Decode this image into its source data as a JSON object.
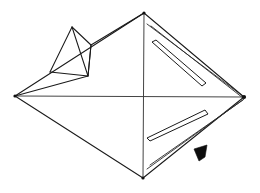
{
  "figure": {
    "kind": "line-drawing",
    "background_color": "#ffffff",
    "line_color": "#1a1a1a",
    "fill_color": "#0d0d0d",
    "canvas": {
      "width": 260,
      "height": 193
    }
  },
  "body": {
    "name": "main-diamond-body",
    "vertices": {
      "left": {
        "x": 15,
        "y": 96
      },
      "right": {
        "x": 244,
        "y": 97
      },
      "top": {
        "x": 144,
        "y": 13
      },
      "bottom": {
        "x": 143,
        "y": 178
      }
    },
    "outline_path": "M15,96 L144,13 L244,97 L143,178 Z",
    "midline_horizontal": "M15,96 L244,97",
    "midline_vertical": "M144,13 L143,178",
    "upper_left_ridge": "M15,96 L88,76 L91,45 L144,13",
    "left_lower_edge": "M15,96 L143,178",
    "right_upper_edge": "M144,13 L244,97",
    "right_lower_edge": "M244,97 L143,178"
  },
  "tetrahedron": {
    "name": "tetrahedral-protrusion",
    "apex": {
      "x": 72,
      "y": 27
    },
    "base_left": {
      "x": 50,
      "y": 72
    },
    "base_front": {
      "x": 88,
      "y": 76
    },
    "base_right": {
      "x": 91,
      "y": 45
    },
    "edges": [
      "M72,27 L50,72",
      "M72,27 L88,76",
      "M72,27 L91,45",
      "M50,72 L88,76",
      "M88,76 L91,45"
    ]
  },
  "slots": [
    {
      "name": "upper-right-slot",
      "face": "upper-right",
      "outline": "M152,42 L202,86 L206,83 L156,40 Z"
    },
    {
      "name": "lower-right-slot",
      "face": "lower-right",
      "outline": "M150,141 L208,114 L205,110 L147,138 Z"
    }
  ],
  "rims": [
    {
      "name": "upper-right-face-rim",
      "path": "M147,24 L244,97"
    },
    {
      "name": "upper-right-face-rim-inner",
      "path": "M151,26 L243,98"
    },
    {
      "name": "lower-right-face-rim",
      "path": "M147,169 L244,99"
    },
    {
      "name": "lower-right-face-rim-inner",
      "path": "M150,165 L243,100"
    }
  ],
  "marker": {
    "name": "solid-arrow-marker",
    "path": "M194,149 L207,145 L205,157 L199,161 Z",
    "color": "#0d0d0d"
  }
}
